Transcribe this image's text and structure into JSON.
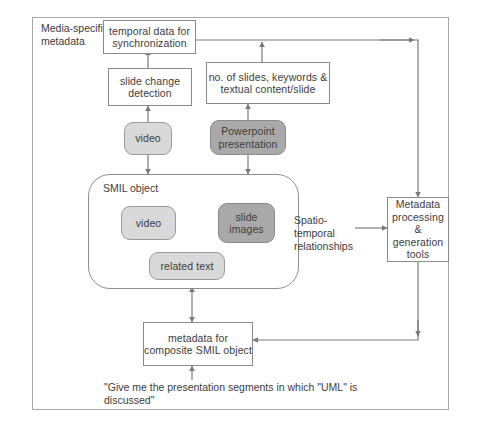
{
  "diagram": {
    "title_label": "Media-specific metadata",
    "smil_container_label": "SMIL object",
    "edge_label_spatio": "Spatio-temporal relationships",
    "query_quote": "\"Give me the presentation segments in which \"UML\" is discussed\"",
    "nodes": {
      "temporal_data": "temporal data for synchronization",
      "slide_change": "slide change detection",
      "slide_stats": "no. of slides, keywords & textual content/slide",
      "video_top": "video",
      "powerpoint": "Powerpoint presentation",
      "video_inner": "video",
      "slide_images": "slide images",
      "related_text": "related text",
      "metadata_tools": "Metadata processing & generation tools",
      "composite_metadata": "metadata for composite SMIL object"
    },
    "colors": {
      "light_fill": "#d9d9d9",
      "dark_fill": "#a9a9a9",
      "stroke": "#8a8a8a",
      "frame": "#a8a8a8",
      "text": "#3c3c3c",
      "background": "#ffffff"
    }
  }
}
